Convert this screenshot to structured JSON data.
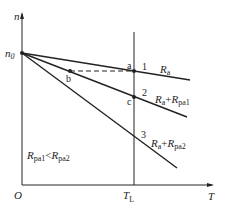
{
  "diagram": {
    "axes": {
      "y_label": "n",
      "x_label": "T",
      "origin_label": "O",
      "y_intercept_label": "n",
      "y_intercept_sub": "0",
      "x_mark_label": "T",
      "x_mark_sub": "L"
    },
    "lines": [
      {
        "number": "1",
        "label_main": "R",
        "label_sub": "a",
        "label_plus": "",
        "label_main2": "",
        "label_sub2": ""
      },
      {
        "number": "2",
        "label_main": "R",
        "label_sub": "a",
        "label_plus": "+",
        "label_main2": "R",
        "label_sub2": "pa1"
      },
      {
        "number": "3",
        "label_main": "R",
        "label_sub": "a",
        "label_plus": "+",
        "label_main2": "R",
        "label_sub2": "pa2"
      }
    ],
    "points": {
      "a": "a",
      "b": "b",
      "c": "c"
    },
    "condition": {
      "r1": "R",
      "r1_sub": "pa1",
      "op": "<",
      "r2": "R",
      "r2_sub": "pa2"
    },
    "colors": {
      "line": "#222222",
      "background": "#ffffff"
    }
  }
}
